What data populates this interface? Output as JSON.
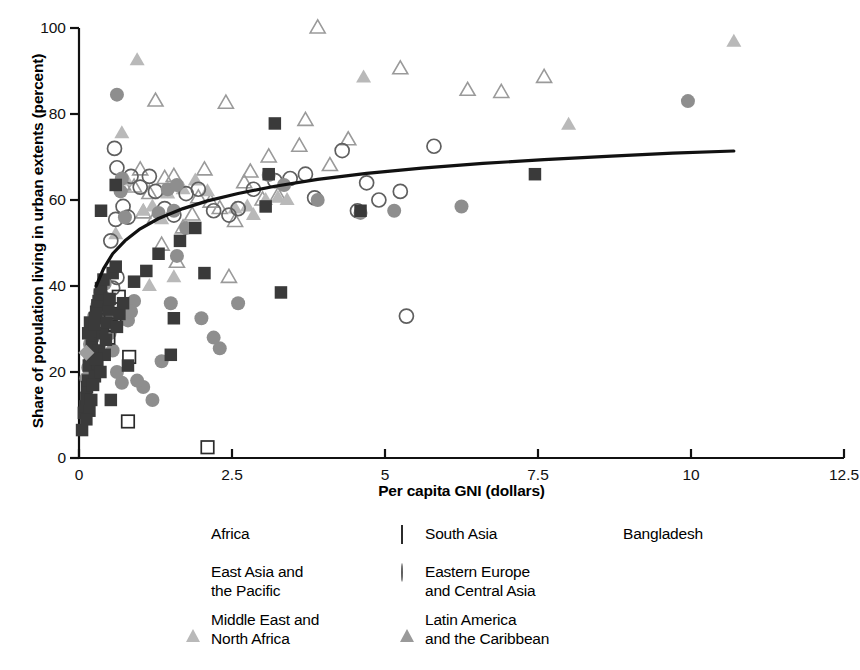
{
  "chart_data": {
    "type": "scatter",
    "title": "",
    "xlabel": "Per capita GNI (dollars)",
    "ylabel": "Share of population living in urban extents (percent)",
    "xlim": [
      0,
      12.5
    ],
    "ylim": [
      0,
      100
    ],
    "xticks": [
      "0",
      "2.5",
      "5",
      "7.5",
      "10",
      "12.5"
    ],
    "xtick_values": [
      0,
      2.5,
      5,
      7.5,
      10,
      12.5
    ],
    "yticks": [
      "0",
      "20",
      "40",
      "60",
      "80",
      "100"
    ],
    "ytick_values": [
      0,
      20,
      40,
      60,
      80,
      100
    ],
    "grid": false,
    "legend_position": "bottom",
    "trendline": {
      "name": "fitted curve",
      "color": "#111111",
      "points": [
        [
          0.28,
          40.0
        ],
        [
          0.4,
          44.0
        ],
        [
          0.55,
          47.5
        ],
        [
          0.75,
          50.5
        ],
        [
          1.0,
          53.3
        ],
        [
          1.3,
          55.7
        ],
        [
          1.7,
          58.0
        ],
        [
          2.1,
          59.8
        ],
        [
          2.6,
          61.5
        ],
        [
          3.2,
          63.2
        ],
        [
          3.9,
          64.8
        ],
        [
          4.7,
          66.2
        ],
        [
          5.6,
          67.4
        ],
        [
          6.6,
          68.5
        ],
        [
          7.6,
          69.4
        ],
        [
          8.7,
          70.2
        ],
        [
          9.7,
          70.9
        ],
        [
          10.7,
          71.4
        ]
      ]
    },
    "series": [
      {
        "name": "Africa",
        "marker": "square-filled",
        "color": "#3a3a3a",
        "points": [
          [
            0.05,
            6.5
          ],
          [
            0.08,
            10.5
          ],
          [
            0.1,
            12.0
          ],
          [
            0.12,
            14.0
          ],
          [
            0.13,
            16.5
          ],
          [
            0.15,
            18.0
          ],
          [
            0.16,
            21.5
          ],
          [
            0.18,
            22.5
          ],
          [
            0.2,
            24.5
          ],
          [
            0.21,
            26.0
          ],
          [
            0.22,
            28.5
          ],
          [
            0.24,
            29.5
          ],
          [
            0.18,
            31.5
          ],
          [
            0.26,
            32.5
          ],
          [
            0.28,
            34.0
          ],
          [
            0.3,
            35.5
          ],
          [
            0.32,
            36.5
          ],
          [
            0.34,
            38.0
          ],
          [
            0.36,
            39.5
          ],
          [
            0.4,
            41.5
          ],
          [
            0.38,
            29.0
          ],
          [
            0.33,
            25.0
          ],
          [
            0.3,
            22.0
          ],
          [
            0.26,
            19.0
          ],
          [
            0.23,
            17.0
          ],
          [
            0.2,
            13.5
          ],
          [
            0.17,
            11.0
          ],
          [
            0.12,
            9.0
          ],
          [
            0.45,
            31.5
          ],
          [
            0.48,
            34.5
          ],
          [
            0.5,
            37.0
          ],
          [
            0.44,
            27.5
          ],
          [
            0.42,
            24.0
          ],
          [
            0.55,
            43.0
          ],
          [
            0.6,
            44.5
          ],
          [
            0.36,
            57.5
          ],
          [
            0.6,
            63.5
          ],
          [
            0.62,
            30.5
          ],
          [
            0.66,
            33.5
          ],
          [
            0.72,
            36.0
          ],
          [
            0.8,
            21.5
          ],
          [
            0.9,
            41.0
          ],
          [
            1.1,
            43.5
          ],
          [
            1.3,
            47.5
          ],
          [
            1.5,
            24.0
          ],
          [
            1.55,
            32.5
          ],
          [
            1.65,
            50.5
          ],
          [
            1.9,
            53.5
          ],
          [
            2.05,
            43.0
          ],
          [
            3.05,
            58.5
          ],
          [
            3.1,
            66.0
          ],
          [
            3.2,
            77.8
          ],
          [
            3.3,
            38.5
          ],
          [
            4.6,
            57.5
          ],
          [
            7.45,
            66.0
          ],
          [
            0.52,
            13.5
          ],
          [
            0.15,
            29.0
          ],
          [
            0.25,
            31.0
          ],
          [
            0.28,
            23.0
          ],
          [
            0.35,
            20.0
          ]
        ]
      },
      {
        "name": "East Asia and the Pacific",
        "marker": "circle-filled",
        "color": "#8e8e8e",
        "points": [
          [
            0.12,
            18.5
          ],
          [
            0.15,
            21.0
          ],
          [
            0.18,
            26.5
          ],
          [
            0.22,
            29.5
          ],
          [
            0.25,
            33.0
          ],
          [
            0.3,
            35.5
          ],
          [
            0.35,
            38.5
          ],
          [
            0.42,
            40.5
          ],
          [
            0.5,
            29.0
          ],
          [
            0.55,
            25.0
          ],
          [
            0.62,
            20.0
          ],
          [
            0.7,
            17.5
          ],
          [
            0.48,
            33.5
          ],
          [
            0.8,
            32.0
          ],
          [
            0.9,
            36.5
          ],
          [
            1.05,
            16.5
          ],
          [
            1.2,
            13.5
          ],
          [
            1.35,
            22.5
          ],
          [
            1.5,
            36.0
          ],
          [
            1.6,
            47.0
          ],
          [
            1.75,
            53.5
          ],
          [
            2.0,
            32.5
          ],
          [
            0.7,
            65.0
          ],
          [
            0.68,
            62.0
          ],
          [
            1.3,
            57.0
          ],
          [
            1.55,
            57.5
          ],
          [
            1.45,
            62.5
          ],
          [
            1.6,
            63.5
          ],
          [
            2.2,
            28.0
          ],
          [
            2.3,
            25.5
          ],
          [
            2.6,
            36.0
          ],
          [
            3.1,
            65.8
          ],
          [
            3.35,
            63.5
          ],
          [
            3.9,
            60.0
          ],
          [
            4.6,
            57.0
          ],
          [
            5.15,
            57.5
          ],
          [
            6.25,
            58.5
          ],
          [
            9.95,
            83.0
          ],
          [
            0.62,
            84.5
          ],
          [
            0.75,
            56.0
          ],
          [
            0.85,
            34.0
          ],
          [
            0.95,
            18.0
          ]
        ]
      },
      {
        "name": "Middle East and North Africa",
        "marker": "triangle-filled",
        "color": "#b9b9b9",
        "points": [
          [
            0.7,
            75.5
          ],
          [
            0.95,
            92.5
          ],
          [
            0.78,
            64.5
          ],
          [
            1.05,
            57.5
          ],
          [
            1.2,
            58.5
          ],
          [
            1.35,
            55.5
          ],
          [
            1.45,
            61.5
          ],
          [
            1.7,
            62.5
          ],
          [
            1.9,
            64.5
          ],
          [
            2.1,
            62.0
          ],
          [
            2.55,
            58.0
          ],
          [
            2.75,
            58.5
          ],
          [
            2.85,
            56.5
          ],
          [
            3.05,
            60.0
          ],
          [
            3.25,
            60.5
          ],
          [
            3.4,
            60.0
          ],
          [
            4.65,
            88.5
          ],
          [
            8.0,
            77.5
          ],
          [
            10.7,
            96.8
          ],
          [
            1.15,
            40.0
          ],
          [
            1.55,
            42.0
          ],
          [
            0.6,
            52.0
          ]
        ]
      },
      {
        "name": "South Asia",
        "marker": "square-open",
        "color": "#2b2b2b",
        "points": [
          [
            0.3,
            26.5
          ],
          [
            0.42,
            35.0
          ],
          [
            0.52,
            33.5
          ],
          [
            0.65,
            37.5
          ],
          [
            0.58,
            31.0
          ],
          [
            0.48,
            28.0
          ],
          [
            0.82,
            23.5
          ],
          [
            0.8,
            8.5
          ],
          [
            2.1,
            2.5
          ]
        ]
      },
      {
        "name": "Eastern Europe and Central Asia",
        "marker": "circle-open",
        "color": "#5f5f5f",
        "points": [
          [
            0.3,
            30.0
          ],
          [
            0.38,
            33.0
          ],
          [
            0.55,
            39.5
          ],
          [
            0.62,
            42.0
          ],
          [
            0.52,
            50.5
          ],
          [
            0.6,
            55.5
          ],
          [
            0.72,
            58.5
          ],
          [
            0.8,
            56.0
          ],
          [
            0.85,
            65.5
          ],
          [
            0.62,
            67.5
          ],
          [
            1.0,
            63.0
          ],
          [
            1.15,
            65.5
          ],
          [
            1.25,
            62.0
          ],
          [
            1.4,
            58.0
          ],
          [
            1.55,
            56.5
          ],
          [
            1.75,
            61.5
          ],
          [
            1.95,
            62.5
          ],
          [
            2.2,
            57.5
          ],
          [
            2.45,
            56.5
          ],
          [
            2.6,
            58.0
          ],
          [
            3.2,
            64.5
          ],
          [
            3.45,
            65.0
          ],
          [
            3.7,
            66.0
          ],
          [
            3.85,
            60.5
          ],
          [
            4.3,
            71.5
          ],
          [
            4.55,
            57.5
          ],
          [
            4.9,
            60.0
          ],
          [
            5.25,
            62.0
          ],
          [
            5.35,
            33.0
          ],
          [
            5.8,
            72.5
          ],
          [
            0.58,
            72.0
          ],
          [
            2.85,
            62.5
          ],
          [
            4.7,
            64.0
          ]
        ]
      },
      {
        "name": "Latin America and the Caribbean",
        "marker": "triangle-open",
        "color": "#9a9a9a",
        "points": [
          [
            0.72,
            63.5
          ],
          [
            0.9,
            63.0
          ],
          [
            1.0,
            67.0
          ],
          [
            1.15,
            61.5
          ],
          [
            1.05,
            57.0
          ],
          [
            1.25,
            56.0
          ],
          [
            1.4,
            65.0
          ],
          [
            1.55,
            65.5
          ],
          [
            1.7,
            53.5
          ],
          [
            1.85,
            56.5
          ],
          [
            1.95,
            60.5
          ],
          [
            2.15,
            59.5
          ],
          [
            2.3,
            58.0
          ],
          [
            2.45,
            42.0
          ],
          [
            2.55,
            55.0
          ],
          [
            2.8,
            66.5
          ],
          [
            3.0,
            60.0
          ],
          [
            3.25,
            61.0
          ],
          [
            3.1,
            70.0
          ],
          [
            3.6,
            72.5
          ],
          [
            3.9,
            100.0
          ],
          [
            3.7,
            78.5
          ],
          [
            4.4,
            74.0
          ],
          [
            5.25,
            90.5
          ],
          [
            2.4,
            82.5
          ],
          [
            1.25,
            83.0
          ],
          [
            6.35,
            85.5
          ],
          [
            6.9,
            85.0
          ],
          [
            7.6,
            88.5
          ],
          [
            2.05,
            67.0
          ],
          [
            1.6,
            45.5
          ],
          [
            1.35,
            49.5
          ],
          [
            2.7,
            64.0
          ],
          [
            4.1,
            68.0
          ]
        ]
      },
      {
        "name": "Bangladesh",
        "marker": "diamond-filled",
        "color": "#9d9d9d",
        "points": [
          [
            0.12,
            24.5
          ]
        ]
      }
    ]
  },
  "legend": {
    "entries": [
      {
        "label": "Africa",
        "marker": "square-filled"
      },
      {
        "label": "South Asia",
        "marker": "square-open"
      },
      {
        "label": "Bangladesh",
        "marker": "diamond-filled"
      },
      {
        "label": "East Asia and\nthe Pacific",
        "marker": "circle-filled"
      },
      {
        "label": "Eastern Europe\nand Central Asia",
        "marker": "circle-open"
      },
      {
        "label": "Middle East and\nNorth Africa",
        "marker": "triangle-filled"
      },
      {
        "label": "Latin America\nand the Caribbean",
        "marker": "triangle-open"
      }
    ]
  }
}
